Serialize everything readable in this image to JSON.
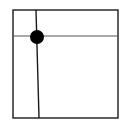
{
  "diagram": {
    "canvas": {
      "width": 130,
      "height": 126,
      "background": "#ffffff"
    },
    "stroke_color": "#1a1a1a",
    "frame": {
      "x1": 13,
      "y1": 10,
      "x2": 118,
      "y2": 118
    },
    "vertical_divider": {
      "x_top": 36,
      "x_bottom": 39,
      "y1": 10,
      "y2": 118
    },
    "horizontal_divider": {
      "y": 36,
      "x1": 13,
      "x2": 118
    },
    "intersection_dot": {
      "cx": 37,
      "cy": 37,
      "r": 7,
      "color": "#000000"
    }
  }
}
